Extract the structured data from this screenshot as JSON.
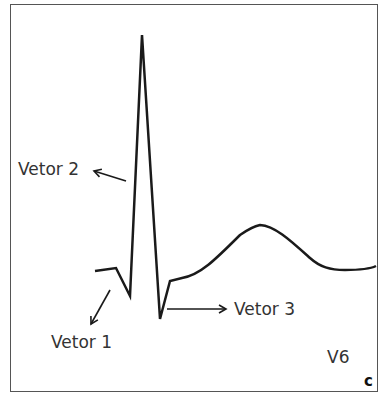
{
  "labels": {
    "vetor1": "Vetor 1",
    "vetor2": "Vetor 2",
    "vetor3": "Vetor 3",
    "lead": "V6",
    "panel": "C"
  },
  "colors": {
    "stroke": "#1a1a1a",
    "text": "#333333",
    "border": "#555555"
  }
}
